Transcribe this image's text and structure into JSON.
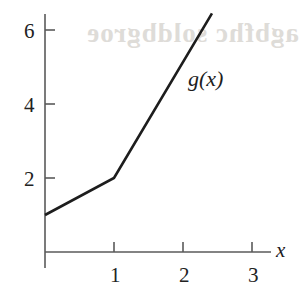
{
  "figure": {
    "background_color": "#ffffff",
    "ink_color": "#1d1d1d",
    "axis_color": "#555555",
    "bleed_through_text": "agbfhc soldbgroe",
    "axis_x_label": "x",
    "curve_label": "g(x)"
  },
  "chart_data": {
    "type": "line",
    "title": "",
    "xlabel": "x",
    "ylabel": "",
    "grid": false,
    "legend": "none",
    "annotations": [
      {
        "text": "g(x)",
        "x": 2.1,
        "y": 4.8
      }
    ],
    "xlim": [
      0,
      3.3
    ],
    "ylim": [
      0,
      6.9
    ],
    "xticks": [
      1,
      2,
      3
    ],
    "xticklabels": [
      "1",
      "2",
      "3"
    ],
    "yticks": [
      2,
      4,
      6
    ],
    "yticklabels": [
      "2",
      "4",
      "6"
    ],
    "series": [
      {
        "name": "g(x)",
        "x": [
          0,
          1,
          2.42
        ],
        "y": [
          1,
          2,
          6.45
        ]
      }
    ]
  },
  "axis": {
    "x_ticks": [
      {
        "label": "1",
        "value": 1
      },
      {
        "label": "2",
        "value": 2
      },
      {
        "label": "3",
        "value": 3
      }
    ],
    "y_ticks": [
      {
        "label": "6",
        "value": 6
      },
      {
        "label": "4",
        "value": 4
      },
      {
        "label": "2",
        "value": 2
      }
    ]
  }
}
